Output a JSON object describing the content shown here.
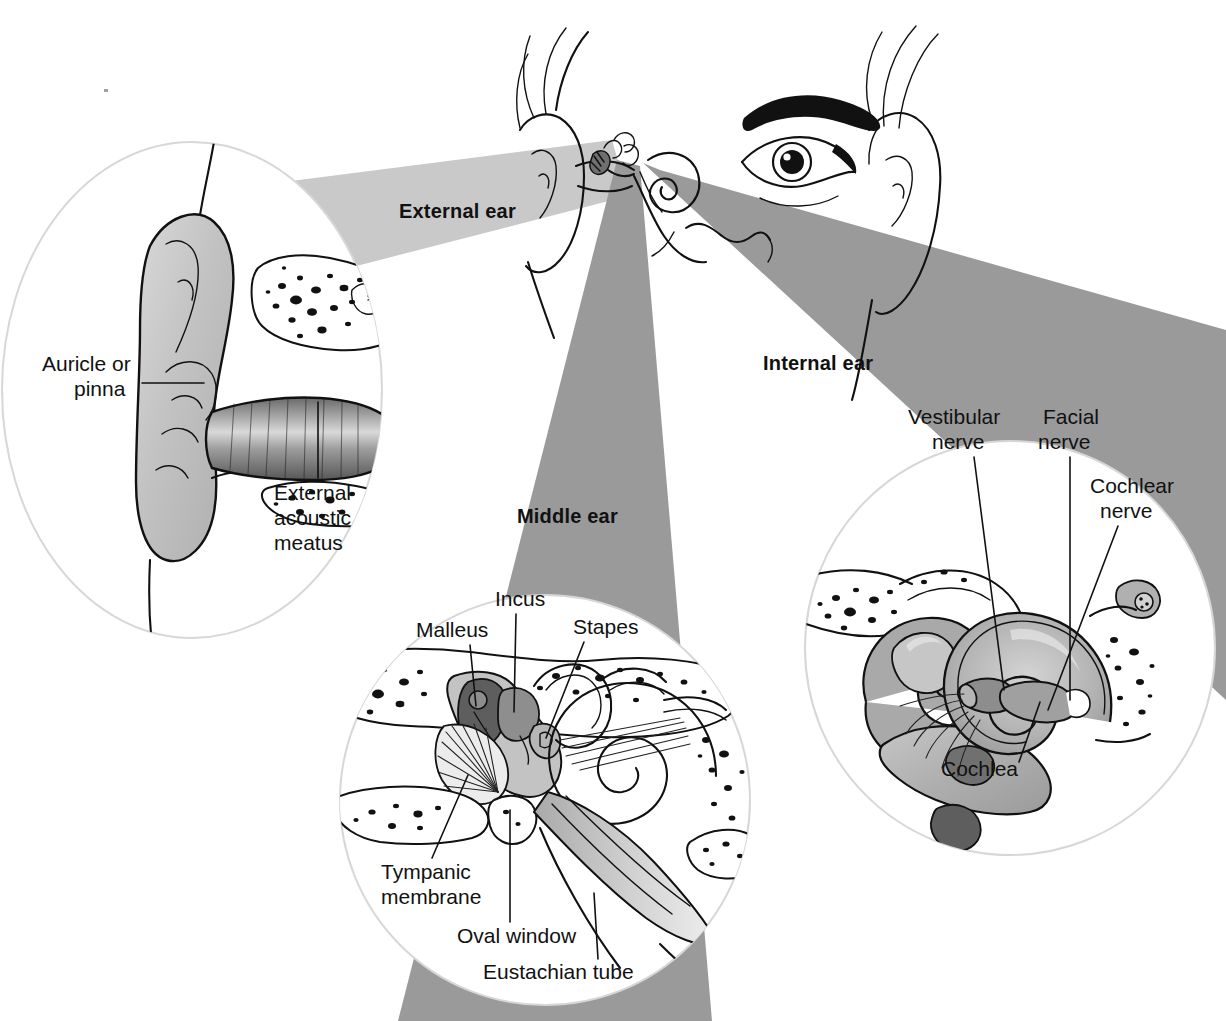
{
  "figure": {
    "type": "anatomical-illustration",
    "palette": {
      "background": "#ffffff",
      "wedge_light": "#c9c9c9",
      "wedge_dark": "#9a9a9a",
      "circle_stroke": "#d7d7d7",
      "ink": "#111111",
      "tissue_mid": "#b0b0b0",
      "tissue_dark": "#6f6f6f",
      "tissue_light": "#d8d8d8"
    }
  },
  "regions": {
    "external": {
      "heading": "External ear",
      "labels": [
        {
          "id": "auricle",
          "text_line1": "Auricle or",
          "text_line2": "pinna"
        },
        {
          "id": "meatus",
          "text_line1": "External",
          "text_line2": "acoustic",
          "text_line3": "meatus"
        }
      ]
    },
    "middle": {
      "heading": "Middle ear",
      "labels": [
        {
          "id": "malleus",
          "text": "Malleus"
        },
        {
          "id": "incus",
          "text": "Incus"
        },
        {
          "id": "stapes",
          "text": "Stapes"
        },
        {
          "id": "tympanic",
          "text_line1": "Tympanic",
          "text_line2": "membrane"
        },
        {
          "id": "oval-window",
          "text": "Oval window"
        },
        {
          "id": "eustachian",
          "text": "Eustachian tube"
        }
      ]
    },
    "internal": {
      "heading": "Internal ear",
      "labels": [
        {
          "id": "vestibular",
          "text_line1": "Vestibular",
          "text_line2": "nerve"
        },
        {
          "id": "facial",
          "text_line1": "Facial",
          "text_line2": "nerve"
        },
        {
          "id": "cochlear",
          "text_line1": "Cochlear",
          "text_line2": "nerve"
        },
        {
          "id": "cochlea",
          "text": "Cochlea"
        }
      ]
    }
  },
  "head": {
    "description": "Frontal view of face showing eye, eyebrow, hair and both ears with inset ear anatomy"
  }
}
